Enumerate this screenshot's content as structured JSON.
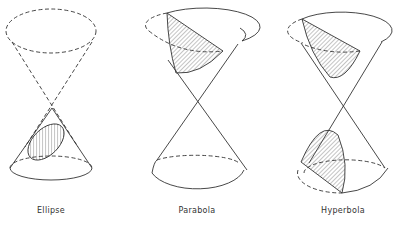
{
  "figure": {
    "panels": [
      {
        "id": "ellipse",
        "label": "Ellipse"
      },
      {
        "id": "parabola",
        "label": "Parabola"
      },
      {
        "id": "hyperbola",
        "label": "Hyperbola"
      }
    ],
    "colors": {
      "line": "#333333",
      "background": "#ffffff"
    }
  }
}
